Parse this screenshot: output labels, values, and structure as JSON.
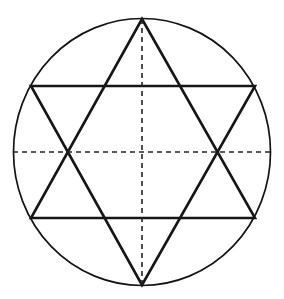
{
  "figure": {
    "background_color": "#ffffff",
    "canvas": {
      "width": 284,
      "height": 299
    }
  },
  "chart_data": {
    "type": "diagram",
    "xlabel": "",
    "ylabel": "",
    "grid": false,
    "legend": "none",
    "geometry": {
      "circle": {
        "name": "circumscribed-circle",
        "center": [
          142,
          152
        ],
        "radius": 131,
        "stroke_color": "#141414",
        "stroke_width": 1.7,
        "fill": "none"
      },
      "triangle_up": {
        "name": "upward-triangle",
        "points": [
          [
            142,
            19
          ],
          [
            31,
            218
          ],
          [
            255,
            218
          ]
        ],
        "stroke_color": "#161616",
        "stroke_width": 2.6,
        "fill": "none"
      },
      "triangle_down": {
        "name": "downward-triangle",
        "points": [
          [
            142,
            285
          ],
          [
            31,
            86
          ],
          [
            255,
            86
          ]
        ],
        "stroke_color": "#161616",
        "stroke_width": 2.6,
        "fill": "none"
      },
      "axis_vertical": {
        "name": "vertical-axis",
        "from": [
          142,
          19
        ],
        "to": [
          142,
          285
        ],
        "style": "dashed",
        "dash_pattern": "5 4",
        "stroke_color": "#242424",
        "stroke_width": 1.6
      },
      "axis_horizontal": {
        "name": "horizontal-axis",
        "from": [
          13,
          152
        ],
        "to": [
          271,
          152
        ],
        "style": "dashed",
        "dash_pattern": "5 4",
        "stroke_color": "#242424",
        "stroke_width": 1.6
      },
      "star_points_on_circle": [
        [
          142,
          19
        ],
        [
          255,
          86
        ],
        [
          255,
          218
        ],
        [
          142,
          285
        ],
        [
          31,
          218
        ],
        [
          31,
          86
        ]
      ],
      "inner_hexagon_vertices": [
        [
          142,
          86
        ],
        [
          216,
          119
        ],
        [
          216,
          185
        ],
        [
          142,
          218
        ],
        [
          69,
          185
        ],
        [
          69,
          119
        ]
      ],
      "axis_intersections": [
        [
          69,
          152
        ],
        [
          216,
          152
        ],
        [
          142,
          152
        ]
      ]
    }
  }
}
